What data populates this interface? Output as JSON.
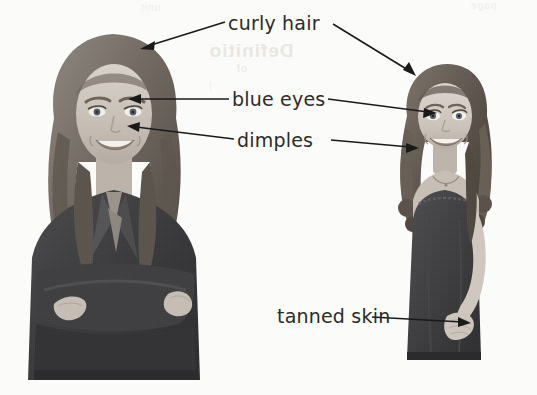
{
  "figure": {
    "name": "annotated-portraits",
    "background_color": "#fbfbf9",
    "ink_color": "#1a1a1a",
    "label_color": "#2b2b2b"
  },
  "bleed_through": {
    "title": "Definition",
    "subtitle": "of",
    "body": "the word",
    "top_left": "unit",
    "top_right": "page"
  },
  "labels": [
    {
      "id": "curly-hair",
      "text": "curly hair",
      "targets": [
        "woman-hair",
        "girl-hair"
      ]
    },
    {
      "id": "blue-eyes",
      "text": "blue eyes",
      "targets": [
        "woman-eye",
        "girl-eye"
      ]
    },
    {
      "id": "dimples",
      "text": "dimples",
      "targets": [
        "woman-cheek",
        "girl-cheek"
      ]
    },
    {
      "id": "tanned-skin",
      "text": "tanned skin",
      "targets": [
        "girl-arm"
      ]
    }
  ],
  "photos": [
    {
      "id": "woman",
      "subject": "adult woman",
      "description": "smiling woman with long wavy hair wearing a dark blazer, arms crossed",
      "rendering": "grayscale halftone photograph"
    },
    {
      "id": "girl",
      "subject": "young girl",
      "description": "smiling girl with long curly hair wearing a dark sleeveless dress, hand on hip",
      "rendering": "grayscale halftone photograph"
    }
  ]
}
